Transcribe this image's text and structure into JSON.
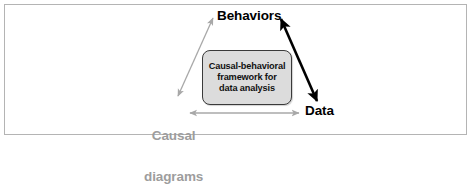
{
  "figure": {
    "frame_border_color": "#b4b4b4",
    "background_color": "#ffffff"
  },
  "nodes": {
    "behaviors": {
      "label": "Behaviors",
      "color": "#000000"
    },
    "data": {
      "label": "Data",
      "color": "#000000"
    },
    "causal_diagrams": {
      "label_line1": "Causal",
      "label_line2": "diagrams",
      "color": "#9d9d9d"
    }
  },
  "center_box": {
    "line1": "Causal-behavioral",
    "line2": "framework for",
    "line3": "data analysis",
    "fill_color": "#dcdcdc",
    "border_color": "#3a3a3a",
    "text_color": "#111111"
  },
  "arrows": [
    {
      "name": "causal-diagrams-to-behaviors",
      "from": "Causal diagrams",
      "to": "Behaviors",
      "style": "double-headed",
      "color": "#a8a8a8",
      "weight": "thin"
    },
    {
      "name": "behaviors-to-data",
      "from": "Behaviors",
      "to": "Data",
      "style": "double-headed",
      "color": "#000000",
      "weight": "thick"
    },
    {
      "name": "causal-diagrams-to-data",
      "from": "Causal diagrams",
      "to": "Data",
      "style": "double-headed",
      "color": "#a8a8a8",
      "weight": "thin"
    }
  ]
}
